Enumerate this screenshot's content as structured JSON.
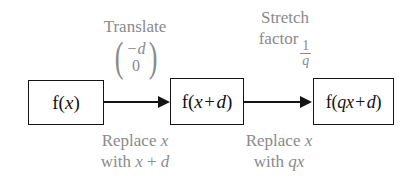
{
  "diagram": {
    "background_color": "#ffffff",
    "box_border_color": "#141414",
    "box_text_color": "#111111",
    "annotation_color": "#8a8a8a",
    "arrow_color": "#141414"
  },
  "boxes": [
    {
      "id": "f-of-x",
      "function_name": "f",
      "open_paren": "(",
      "argument": "x",
      "close_paren": ")",
      "full_text": "f(x)"
    },
    {
      "id": "f-of-x-plus-d",
      "function_name": "f",
      "open_paren": "(",
      "argument_first": "x",
      "operator": "+",
      "argument_second": "d",
      "close_paren": ")",
      "full_text": "f(x + d)"
    },
    {
      "id": "f-of-qx-plus-d",
      "function_name": "f",
      "open_paren": "(",
      "argument_first": "qx",
      "operator": "+",
      "argument_second": "d",
      "close_paren": ")",
      "full_text": "f(qx + d)"
    }
  ],
  "transformations": [
    {
      "id": "translate",
      "above_label": "Translate",
      "vector": {
        "top": "−d",
        "bottom": "0",
        "open_bracket": "(",
        "close_bracket": ")"
      },
      "below_label_line1": "Replace x",
      "below_label_line2": "with x + d",
      "below_line1_static": "Replace",
      "below_line1_var": "x",
      "below_line2_static": "with",
      "below_line2_var_first": "x",
      "below_line2_op": "+",
      "below_line2_var_second": "d"
    },
    {
      "id": "stretch",
      "above_label_line1": "Stretch",
      "above_label_line2": "factor",
      "factor_numerator": "1",
      "factor_denominator": "q",
      "below_label_line1": "Replace x",
      "below_label_line2": "with qx",
      "below_line1_static": "Replace",
      "below_line1_var": "x",
      "below_line2_static": "with",
      "below_line2_var": "qx"
    }
  ],
  "arrows": [
    {
      "id": "arrow-translate",
      "from": "f-of-x",
      "to": "f-of-x-plus-d"
    },
    {
      "id": "arrow-stretch",
      "from": "f-of-x-plus-d",
      "to": "f-of-qx-plus-d"
    }
  ]
}
